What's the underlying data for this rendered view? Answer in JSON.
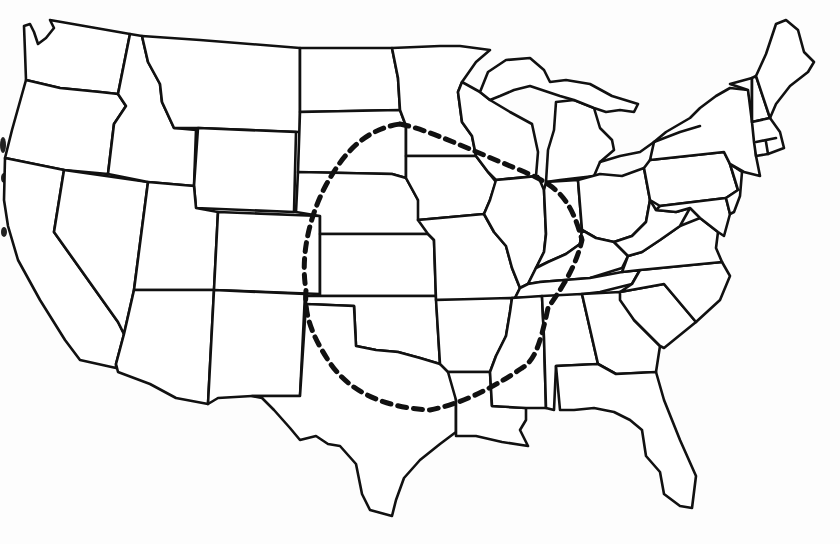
{
  "map": {
    "subject": "Contiguous United States outline map with state borders",
    "style": "black line drawing on white",
    "background_color": "#fdfdfd",
    "line_color": "#111111",
    "labels": [],
    "highlight_region": {
      "shape": "dashed-loop",
      "description": "Dashed oval enclosing central plains and midwest (approx. Nebraska, Kansas, Oklahoma, Missouri, Iowa, Arkansas, Illinois region)",
      "color": "#111111"
    }
  }
}
